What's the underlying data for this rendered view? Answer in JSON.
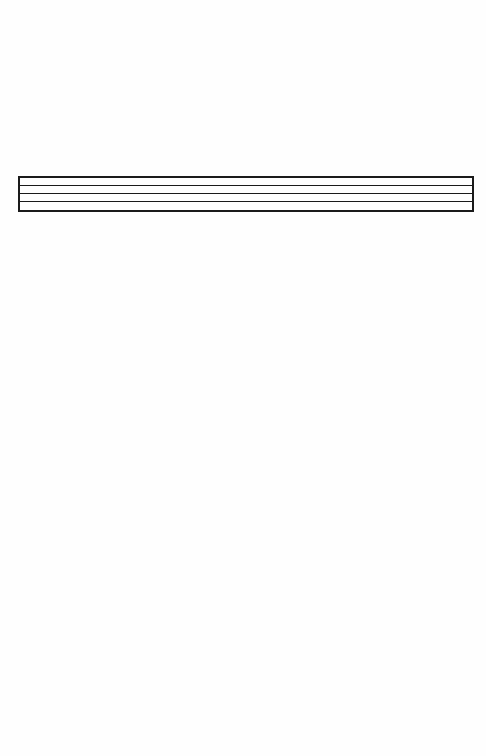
{
  "page": {
    "background": "#fefefe",
    "ink_color": "#1a1a1a"
  },
  "ruled_box": {
    "rows": 4,
    "content": [
      "",
      "",
      "",
      ""
    ]
  }
}
